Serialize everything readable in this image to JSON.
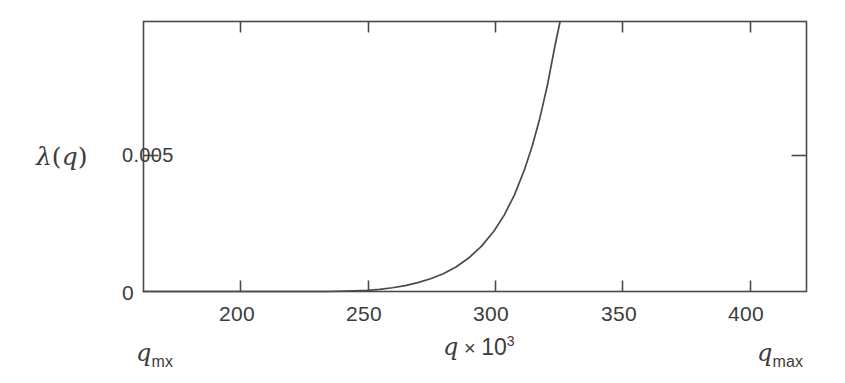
{
  "chart_data": {
    "type": "line",
    "title": "",
    "xlabel": "q × 10³",
    "ylabel": "λ (q)",
    "xlim": [
      162,
      423
    ],
    "ylim": [
      0,
      0.01
    ],
    "grid": false,
    "legend": null,
    "x_ticks": [
      200,
      250,
      300,
      350,
      400
    ],
    "x_tick_labels": [
      "200",
      "250",
      "300",
      "350",
      "400"
    ],
    "y_ticks": [
      0,
      0.005
    ],
    "y_tick_labels": [
      "0",
      "0.005"
    ],
    "series": [
      {
        "name": "λ (q)",
        "color": "#4a4a4a",
        "x": [
          162,
          175,
          190,
          205,
          220,
          235,
          245,
          250,
          255,
          260,
          265,
          270,
          275,
          280,
          285,
          290,
          295,
          300,
          304,
          308,
          312,
          315,
          318,
          321,
          324,
          326,
          328,
          330,
          331,
          332
        ],
        "y": [
          0.0,
          0.0,
          0.0,
          0.0,
          0.0,
          0.0,
          2e-05,
          4e-05,
          8e-05,
          0.00014,
          0.00022,
          0.00033,
          0.00047,
          0.00066,
          0.00091,
          0.00124,
          0.00167,
          0.00224,
          0.00283,
          0.00357,
          0.00452,
          0.00538,
          0.00641,
          0.00764,
          0.00911,
          0.01,
          0.01,
          0.01,
          0.01,
          0.01
        ]
      }
    ],
    "annotations": [
      {
        "id": "q-mx",
        "text_main": "q",
        "text_sub": "mx",
        "position": "below-axis-left"
      },
      {
        "id": "q-max",
        "text_main": "q",
        "text_sub": "max",
        "position": "below-axis-right"
      }
    ],
    "axes_color": "#4a4a4a",
    "background_color": "#ffffff"
  },
  "labels": {
    "ylabel_symbol": "λ",
    "ylabel_arg_open": "(",
    "ylabel_arg": "q",
    "ylabel_arg_close": ")",
    "ytick_0": "0",
    "ytick_0005": "0.005",
    "xlabel_var": "q",
    "xlabel_times": "×",
    "xlabel_base": "10",
    "xlabel_exp": "3",
    "xtick_200": "200",
    "xtick_250": "250",
    "xtick_300": "300",
    "xtick_350": "350",
    "xtick_400": "400",
    "qmx_var": "q",
    "qmx_sub": "mx",
    "qmax_var": "q",
    "qmax_sub": "max"
  }
}
